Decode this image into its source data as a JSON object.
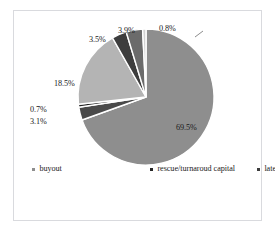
{
  "chart_data": {
    "type": "pie",
    "title": "",
    "subtitle": "",
    "xlabel": "",
    "ylabel": "",
    "legend_position": "bottom",
    "grid": false,
    "units": "percent",
    "categories": [
      "buyout",
      "replacement capital",
      "rescue/turnaroud capital",
      "growth capital",
      "later-stage venture",
      "start-up",
      "seed"
    ],
    "values": [
      69.5,
      3.1,
      0.7,
      18.5,
      3.5,
      3.9,
      0.8
    ],
    "labels": [
      "69.5%",
      "3.1%",
      "0.7%",
      "18.5%",
      "3.5%",
      "3.9%",
      "0.8%"
    ],
    "colors": [
      "#8e8e8e",
      "#4a4a4a",
      "#262626",
      "#b4b4b4",
      "#3d3d3d",
      "#6b6b6b",
      "#d2d2d2"
    ],
    "slices": [
      {
        "name": "buyout",
        "value": 69.5,
        "label": "69.5%",
        "color": "#8e8e8e"
      },
      {
        "name": "replacement capital",
        "value": 3.1,
        "label": "3.1%",
        "color": "#4a4a4a"
      },
      {
        "name": "rescue/turnaroud capital",
        "value": 0.7,
        "label": "0.7%",
        "color": "#262626"
      },
      {
        "name": "growth capital",
        "value": 18.5,
        "label": "18.5%",
        "color": "#b4b4b4"
      },
      {
        "name": "later-stage venture",
        "value": 3.5,
        "label": "3.5%",
        "color": "#3d3d3d"
      },
      {
        "name": "start-up",
        "value": 3.9,
        "label": "3.9%",
        "color": "#6b6b6b"
      },
      {
        "name": "seed",
        "value": 0.8,
        "label": "0.8%",
        "color": "#d2d2d2"
      }
    ]
  },
  "chart": {
    "percent_labels": {
      "buyout": "69.5%",
      "growth_capital": "18.5%",
      "later_stage_venture": "3.5%",
      "start_up": "3.9%",
      "seed": "0.8%",
      "rescue_turnaroud_capital": "0.7%",
      "replacement_capital": "3.1%"
    }
  },
  "legend": {
    "items": [
      {
        "label": "buyout",
        "color": "#8e8e8e"
      },
      {
        "label": "rescue/turnaroud capital",
        "color": "#262626"
      },
      {
        "label": "later-stage venture",
        "color": "#3d3d3d"
      },
      {
        "label": "seed",
        "color": "#d2d2d2"
      },
      {
        "label": "replacement capital",
        "color": "#4a4a4a"
      },
      {
        "label": "growth capital",
        "color": "#b4b4b4"
      },
      {
        "label": "start-up",
        "color": "#6b6b6b"
      }
    ]
  },
  "style": {
    "border_color": "#d9dade",
    "background": "#ffffff",
    "separator_color": "#ffffff"
  }
}
